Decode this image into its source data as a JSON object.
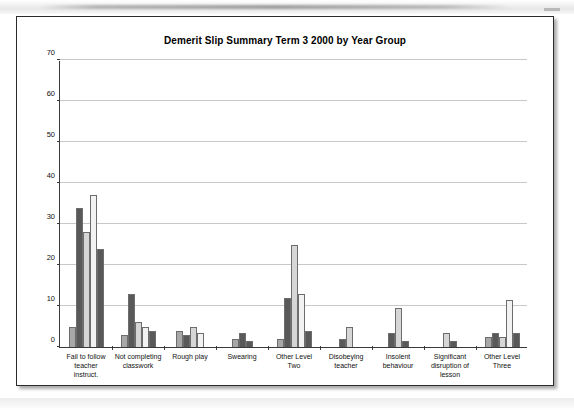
{
  "document": {
    "page_label": "scanned-chart-page"
  },
  "chart_data": {
    "type": "bar",
    "title": "Demerit Slip Summary Term 3 2000  by Year Group",
    "xlabel": "",
    "ylabel": "",
    "ylim": [
      0,
      70
    ],
    "ytick_step": 10,
    "yticks": [
      0,
      10,
      20,
      30,
      40,
      50,
      60,
      70
    ],
    "grid": true,
    "legend": "none",
    "categories": [
      "Fail to follow teacher instruct.",
      "Not completing classwork",
      "Rough play",
      "Swearing",
      "Other Level Two",
      "Disobeying teacher",
      "Insolent behaviour",
      "Significant disruption of lesson",
      "Other Level Three"
    ],
    "category_lines": [
      [
        "Fail to follow",
        "teacher",
        "instruct."
      ],
      [
        "Not completing",
        "classwork"
      ],
      [
        "Rough play"
      ],
      [
        "Swearing"
      ],
      [
        "Other Level",
        "Two"
      ],
      [
        "Disobeying",
        "teacher"
      ],
      [
        "Insolent",
        "behaviour"
      ],
      [
        "Significant",
        "disruption of",
        "lesson"
      ],
      [
        "Other Level",
        "Three"
      ]
    ],
    "series": [
      {
        "name": "Series 1",
        "color": "#a8a8a8",
        "values": [
          5,
          3,
          4,
          2,
          2,
          0,
          0,
          0,
          2.5
        ]
      },
      {
        "name": "Series 2",
        "color": "#595959",
        "values": [
          34,
          13,
          3,
          3.5,
          12,
          2,
          3.5,
          0,
          3.5
        ]
      },
      {
        "name": "Series 3",
        "color": "#d6d6d6",
        "values": [
          28,
          6,
          5,
          0,
          25,
          5,
          9.5,
          3.5,
          2.5
        ]
      },
      {
        "name": "Series 4",
        "color": "#f2f2f2",
        "values": [
          37,
          5,
          3.5,
          0,
          13,
          0,
          0,
          0,
          11.5
        ]
      },
      {
        "name": "Series 5",
        "color": "#595959",
        "values": [
          24,
          4,
          0,
          1.5,
          4,
          0,
          1.5,
          1.5,
          3.5
        ]
      }
    ]
  }
}
